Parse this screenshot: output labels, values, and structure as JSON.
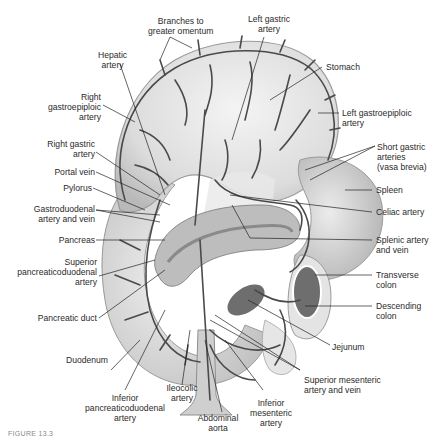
{
  "figure": {
    "caption_fragment": "FIGURE 13.3"
  },
  "labels": {
    "branches_omentum": [
      "Branches to",
      "greater omentum"
    ],
    "left_gastric": [
      "Left gastric",
      "artery"
    ],
    "hepatic": [
      "Hepatic",
      "artery"
    ],
    "stomach": [
      "Stomach"
    ],
    "right_gastroepiploic": [
      "Right",
      "gastroepiploic",
      "artery"
    ],
    "left_gastroepiploic": [
      "Left gastroepiploic",
      "artery"
    ],
    "right_gastric": [
      "Right gastric",
      "artery"
    ],
    "short_gastric": [
      "Short gastric",
      "arteries",
      "(vasa brevia)"
    ],
    "portal_vein": [
      "Portal vein"
    ],
    "pylorus": [
      "Pylorus"
    ],
    "spleen": [
      "Spleen"
    ],
    "gastroduodenal": [
      "Gastroduodenal",
      "artery and vein"
    ],
    "celiac": [
      "Celiac artery"
    ],
    "pancreas": [
      "Pancreas"
    ],
    "splenic": [
      "Splenic artery",
      "and vein"
    ],
    "superior_pd": [
      "Superior",
      "pancreaticoduodenal",
      "artery"
    ],
    "transverse_colon": [
      "Transverse",
      "colon"
    ],
    "pancreatic_duct": [
      "Pancreatic duct"
    ],
    "descending_colon": [
      "Descending",
      "colon"
    ],
    "jejunum": [
      "Jejunum"
    ],
    "duodenum": [
      "Duodenum"
    ],
    "superior_mesenteric": [
      "Superior mesenteric",
      "artery and vein"
    ],
    "inferior_pd": [
      "Inferior",
      "pancreaticoduodenal",
      "artery"
    ],
    "ileocolic": [
      "Ileocolic",
      "artery"
    ],
    "abdominal_aorta": [
      "Abdominal",
      "aorta"
    ],
    "inferior_mesenteric": [
      "Inferior",
      "mesenteric",
      "artery"
    ]
  },
  "colors": {
    "organ_fill": "#d9d9d9",
    "organ_light": "#efefef",
    "organ_edge": "#9a9a9a",
    "vessel": "#4a4a4a",
    "dark_organ": "#6e6e6e",
    "leader": "#222222",
    "text": "#2a2a2a"
  }
}
